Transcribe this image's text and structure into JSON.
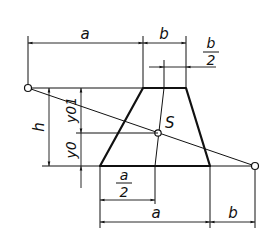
{
  "diagram": {
    "type": "trapezoid centroid construction",
    "labels": {
      "top_a": "a",
      "top_b": "b",
      "b_half_num": "b",
      "b_half_den": "2",
      "h": "h",
      "y01": "y01",
      "y0": "y0",
      "centroid": "S",
      "a_half_num": "a",
      "a_half_den": "2",
      "bottom_a": "a",
      "bottom_b": "b"
    },
    "points": {
      "left_construction_point": [
        28,
        88
      ],
      "right_construction_point": [
        255,
        166
      ],
      "centroid_S": [
        158,
        133
      ],
      "trapezoid_top_left": [
        143,
        88
      ],
      "trapezoid_top_right": [
        186,
        88
      ],
      "trapezoid_bottom_left": [
        100,
        166
      ],
      "trapezoid_bottom_right": [
        210,
        166
      ]
    },
    "colors": {
      "line": "#111111",
      "background": "#ffffff"
    }
  }
}
